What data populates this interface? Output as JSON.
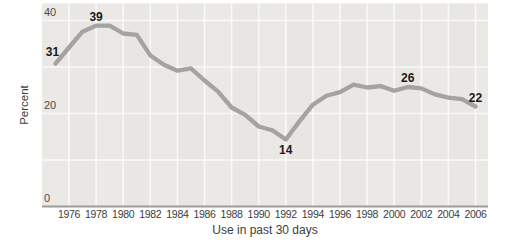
{
  "chart_data": {
    "type": "line",
    "title": "",
    "xlabel": "Use in past 30 days",
    "ylabel": "Percent",
    "x": [
      1975,
      1976,
      1977,
      1978,
      1979,
      1980,
      1981,
      1982,
      1983,
      1984,
      1985,
      1986,
      1987,
      1988,
      1989,
      1990,
      1991,
      1992,
      1993,
      1994,
      1995,
      1996,
      1997,
      1998,
      1999,
      2000,
      2001,
      2002,
      2003,
      2004,
      2005,
      2006
    ],
    "values": [
      30.7,
      34.2,
      37.6,
      38.9,
      38.9,
      37.2,
      36.9,
      32.5,
      30.5,
      29.2,
      29.7,
      27.1,
      24.7,
      21.3,
      19.7,
      17.2,
      16.4,
      14.4,
      18.3,
      21.9,
      23.8,
      24.6,
      26.2,
      25.6,
      25.9,
      24.9,
      25.7,
      25.4,
      24.1,
      23.4,
      23.1,
      21.5
    ],
    "xticks": [
      1976,
      1978,
      1980,
      1982,
      1984,
      1986,
      1988,
      1990,
      1992,
      1994,
      1996,
      1998,
      2000,
      2002,
      2004,
      2006
    ],
    "yticks": [
      40,
      20,
      0
    ],
    "ylim": [
      0,
      43
    ],
    "xlim": [
      1974,
      2007
    ],
    "grid": "on",
    "legend": "none",
    "annotations": [
      {
        "text": "31",
        "year": 1975,
        "value": 30.7,
        "placement": "above-left"
      },
      {
        "text": "39",
        "year": 1978,
        "value": 38.9,
        "placement": "above"
      },
      {
        "text": "14",
        "year": 1992,
        "value": 14.4,
        "placement": "below"
      },
      {
        "text": "26",
        "year": 2001,
        "value": 25.7,
        "placement": "above"
      },
      {
        "text": "22",
        "year": 2006,
        "value": 21.5,
        "placement": "above"
      }
    ],
    "colors": {
      "line": "#a4a3a0",
      "plot_background": "#e8e6e3",
      "gridline": "#ffffff",
      "axis_line": "#9c9b98",
      "tick_label": "#3c3c3c",
      "annotation": "#1b1b1b"
    }
  }
}
